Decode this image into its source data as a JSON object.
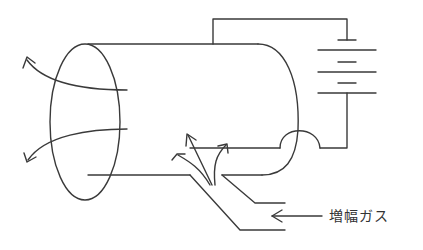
{
  "diagram": {
    "type": "laser discharge tube schematic",
    "label_gas": "増幅ガス",
    "components": [
      {
        "name": "discharge-tube",
        "shape": "cylinder"
      },
      {
        "name": "output-window",
        "shape": "ellipse"
      },
      {
        "name": "battery",
        "cells": 3
      },
      {
        "name": "inner-electrode"
      },
      {
        "name": "gas-inlet"
      }
    ],
    "stroke_color": "#3a3a3a",
    "background": "#ffffff"
  }
}
